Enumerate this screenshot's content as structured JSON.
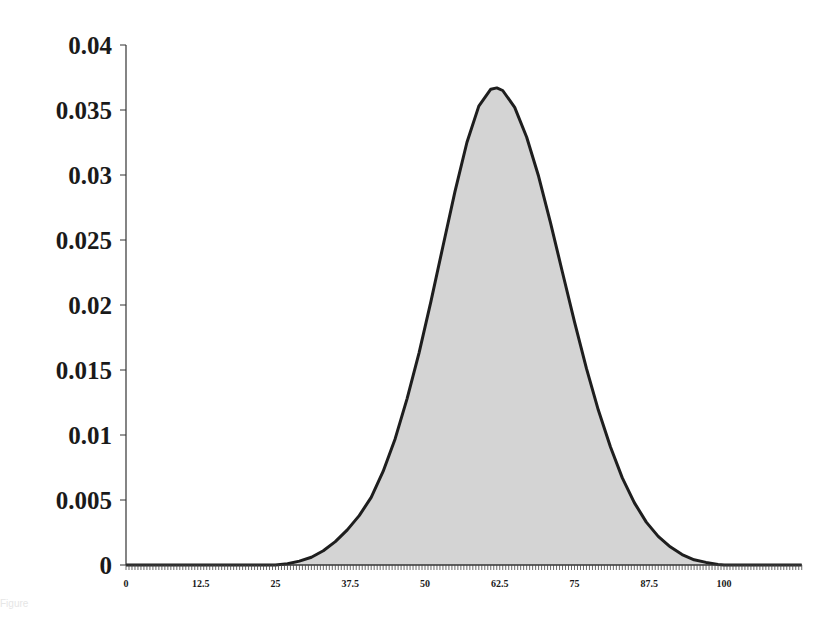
{
  "chart_data": {
    "type": "area",
    "title": "",
    "xlabel": "",
    "ylabel": "",
    "xlim": [
      0,
      113
    ],
    "ylim": [
      0,
      0.04
    ],
    "x_ticks": [
      0,
      12.5,
      25,
      37.5,
      50,
      62.5,
      75,
      87.5,
      100
    ],
    "x_tick_labels": [
      "0",
      "12.5",
      "25",
      "37.5",
      "50",
      "62.5",
      "75",
      "87.5",
      "100"
    ],
    "y_ticks": [
      0,
      0.005,
      0.01,
      0.015,
      0.02,
      0.025,
      0.03,
      0.035,
      0.04
    ],
    "y_tick_labels": [
      "0",
      "0.005",
      "0.01",
      "0.015",
      "0.02",
      "0.025",
      "0.03",
      "0.035",
      "0.04"
    ],
    "grid": false,
    "legend": null,
    "fill_color": "#d4d4d4",
    "line_color": "#1e1e1e",
    "series": [
      {
        "name": "density",
        "x": [
          0,
          10,
          20,
          25,
          27,
          29,
          31,
          33,
          35,
          37,
          39,
          41,
          43,
          45,
          47,
          49,
          51,
          53,
          55,
          57,
          59,
          61,
          62,
          63,
          65,
          67,
          69,
          71,
          73,
          75,
          77,
          79,
          81,
          83,
          85,
          87,
          89,
          91,
          93,
          95,
          97,
          99,
          100,
          113
        ],
        "y": [
          0,
          0,
          0,
          0,
          0.0001,
          0.0003,
          0.0006,
          0.0011,
          0.0018,
          0.0027,
          0.0038,
          0.0052,
          0.0072,
          0.0097,
          0.0128,
          0.0163,
          0.0203,
          0.0245,
          0.0287,
          0.0325,
          0.0353,
          0.0366,
          0.0367,
          0.0365,
          0.0352,
          0.0329,
          0.0299,
          0.0263,
          0.0225,
          0.0187,
          0.0151,
          0.0119,
          0.0091,
          0.0067,
          0.0048,
          0.0033,
          0.0022,
          0.0014,
          0.0008,
          0.0004,
          0.0002,
          5e-05,
          0,
          0
        ]
      }
    ]
  },
  "caption": "Figure"
}
